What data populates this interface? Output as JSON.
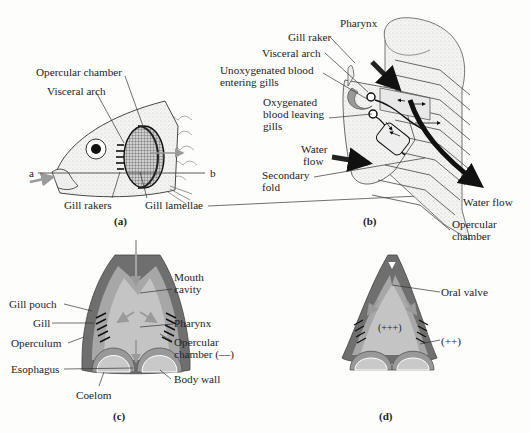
{
  "panels": {
    "a": {
      "caption": "(a)",
      "labels": {
        "opercular_chamber": "Opercular chamber",
        "visceral_arch": "Visceral arch",
        "gill_rakers": "Gill rakers",
        "gill_lamellae": "Gill lamellae",
        "marker_a": "a",
        "marker_b": "b"
      }
    },
    "b": {
      "caption": "(b)",
      "labels": {
        "pharynx": "Pharynx",
        "gill_raker": "Gill raker",
        "visceral_arch": "Visceral arch",
        "unoxygenated_1": "Unoxygenated blood",
        "unoxygenated_2": "entering gills",
        "oxygenated_1": "Oxygenated",
        "oxygenated_2": "blood leaving",
        "oxygenated_3": "gills",
        "water_flow_in_1": "Water",
        "water_flow_in_2": "flow",
        "secondary_fold_1": "Secondary",
        "secondary_fold_2": "fold",
        "water_flow_out": "Water flow",
        "opercular_chamber_1": "Opercular",
        "opercular_chamber_2": "chamber"
      }
    },
    "c": {
      "caption": "(c)",
      "labels": {
        "mouth_cavity_1": "Mouth",
        "mouth_cavity_2": "cavity",
        "gill_pouch": "Gill pouch",
        "gill": "Gill",
        "pharynx": "Pharynx",
        "operculum": "Operculum",
        "opercular_chamber_1": "Opercular",
        "opercular_chamber_2": "chamber (––)",
        "esophagus": "Esophagus",
        "body_wall": "Body wall",
        "coelom": "Coelom"
      }
    },
    "d": {
      "caption": "(d)",
      "labels": {
        "oral_valve": "Oral valve",
        "pressure_high": "(+++)",
        "pressure_mid": "(++)"
      }
    }
  },
  "colors": {
    "tissue_dark": "#6f6f6f",
    "tissue_mid": "#a7a7a7",
    "cavity": "#c4c4c4",
    "arrow": "#9a9a9a",
    "line": "#333333"
  }
}
